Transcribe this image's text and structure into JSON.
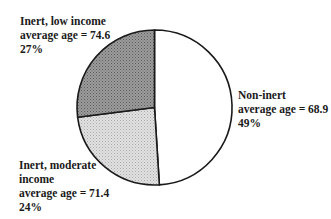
{
  "chart_data": {
    "type": "pie",
    "title": "",
    "slices": [
      {
        "name": "Non-inert",
        "lines": [
          "Non-inert",
          "average age = 68.9",
          "49%"
        ],
        "value": 49,
        "average_age": 68.9,
        "fill": "#ffffff"
      },
      {
        "name": "Inert, moderate income",
        "lines": [
          "Inert, moderate",
          "income",
          "average age = 71.4",
          "24%"
        ],
        "value": 24,
        "average_age": 71.4,
        "fill": "#d6d6d6"
      },
      {
        "name": "Inert, low income",
        "lines": [
          "Inert, low income",
          "average age = 74.6",
          "27%"
        ],
        "value": 27,
        "average_age": 74.6,
        "fill": "#8e8e8e"
      }
    ],
    "start_angle_deg_from_top_clockwise": 0,
    "legend": "none (direct labels)",
    "outline_color": "#1a1a1a"
  },
  "labels": {
    "non_inert": {
      "l1": "Non-inert",
      "l2": "average age = 68.9",
      "l3": "49%"
    },
    "inert_moderate": {
      "l1": "Inert, moderate",
      "l2": "income",
      "l3": "average age = 71.4",
      "l4": "24%"
    },
    "inert_low": {
      "l1": "Inert, low income",
      "l2": "average age = 74.6",
      "l3": "27%"
    }
  }
}
